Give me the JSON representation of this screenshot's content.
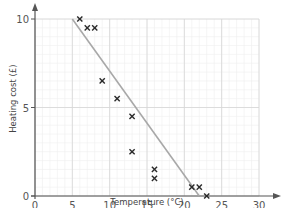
{
  "chart_data": {
    "type": "scatter",
    "title": "",
    "xlabel": "Temperature (°C)",
    "ylabel": "Heating cost (£)",
    "xlim": [
      0,
      30
    ],
    "ylim": [
      0,
      10
    ],
    "x_ticks": [
      0,
      5,
      10,
      15,
      20,
      25,
      30
    ],
    "y_ticks": [
      0,
      5,
      10
    ],
    "grid": true,
    "legend": null,
    "series": [
      {
        "name": "Heating cost",
        "marker": "x",
        "points": [
          {
            "x": 6,
            "y": 10
          },
          {
            "x": 7,
            "y": 9.5
          },
          {
            "x": 8,
            "y": 9.5
          },
          {
            "x": 9,
            "y": 6.5
          },
          {
            "x": 11,
            "y": 5.5
          },
          {
            "x": 13,
            "y": 4.5
          },
          {
            "x": 13,
            "y": 2.5
          },
          {
            "x": 16,
            "y": 1.5
          },
          {
            "x": 16,
            "y": 1
          },
          {
            "x": 21,
            "y": 0.5
          },
          {
            "x": 22,
            "y": 0.5
          },
          {
            "x": 23,
            "y": 0
          }
        ]
      }
    ],
    "trend_line": {
      "x1": 5,
      "y1": 10,
      "x2": 22,
      "y2": 0
    }
  },
  "colors": {
    "marker": "#2a2a2a",
    "trend_line": "#a8a8a8",
    "axis": "#555555",
    "grid_major": "#d6d6d6",
    "grid_minor": "#eeeeee"
  }
}
